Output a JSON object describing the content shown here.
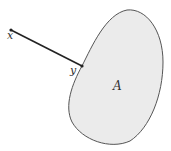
{
  "diagram": {
    "labels": {
      "point_x": "x",
      "point_y": "y",
      "set": "A"
    },
    "colors": {
      "fill": "#ebebeb",
      "stroke": "#555555",
      "segment": "#222222"
    }
  }
}
